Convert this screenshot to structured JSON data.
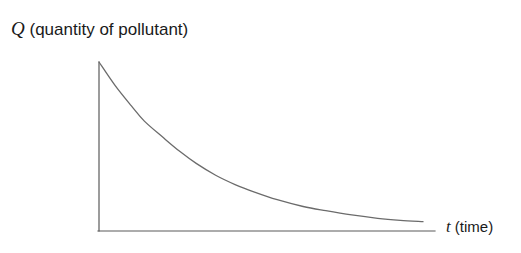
{
  "figure": {
    "background_color": "#ffffff",
    "axis_color": "#5a5a5a",
    "curve_color": "#6b6b6b",
    "text_color": "#1a1a1a"
  },
  "labels": {
    "y_variable": "Q",
    "y_description": "(quantity of pollutant)",
    "x_variable": "t",
    "x_description": "(time)"
  },
  "chart_data": {
    "type": "line",
    "title": "",
    "xlabel": "t (time)",
    "ylabel": "Q (quantity of pollutant)",
    "grid": false,
    "legend": null,
    "axis_ticks": [],
    "tick_labels": [],
    "xlim": [
      0,
      1
    ],
    "ylim": [
      0,
      1
    ],
    "series": [
      {
        "name": "quantity of pollutant",
        "x": [
          0.0,
          0.05,
          0.1,
          0.14,
          0.2,
          0.25,
          0.3,
          0.36,
          0.42,
          0.48,
          0.55,
          0.63,
          0.7,
          0.78,
          0.86,
          0.93,
          1.0
        ],
        "y": [
          1.0,
          0.86,
          0.74,
          0.65,
          0.55,
          0.47,
          0.4,
          0.33,
          0.275,
          0.23,
          0.185,
          0.145,
          0.12,
          0.095,
          0.075,
          0.063,
          0.055
        ]
      }
    ],
    "curve_points_px": [
      [
        99,
        62
      ],
      [
        116,
        86
      ],
      [
        133,
        106
      ],
      [
        145,
        108
      ],
      [
        150,
        130
      ],
      [
        168,
        148
      ],
      [
        185,
        160
      ],
      [
        200,
        160
      ],
      [
        218,
        178
      ],
      [
        235,
        185
      ],
      [
        260,
        188
      ],
      [
        285,
        194
      ],
      [
        310,
        198
      ],
      [
        340,
        206
      ],
      [
        370,
        212
      ],
      [
        398,
        217
      ],
      [
        423,
        220
      ]
    ],
    "axes_px": {
      "y_axis": {
        "x": 99,
        "y_top": 62,
        "y_bottom": 231
      },
      "x_axis": {
        "y": 231,
        "x_left": 98,
        "x_right": 435
      }
    }
  }
}
